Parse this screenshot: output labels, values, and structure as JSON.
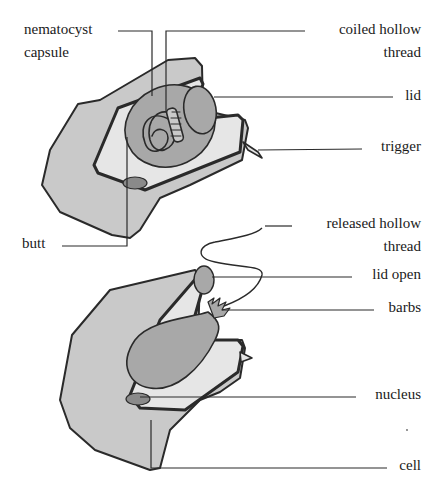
{
  "diagram": {
    "colors": {
      "cell_fill": "#c9c9c9",
      "capsule_fill": "#e6e6e6",
      "organelle_fill": "#a8a8a8",
      "outline": "#2a2a2a",
      "leader_line": "#2a2a2a"
    },
    "top_figure": {
      "state": "undischarged",
      "labels": [
        {
          "id": "nematocyst-capsule",
          "line1": "nematocyst",
          "line2": "capsule"
        },
        {
          "id": "coiled-hollow-thread",
          "line1": "coiled hollow",
          "line2": "thread"
        },
        {
          "id": "lid",
          "line1": "lid"
        },
        {
          "id": "trigger",
          "line1": "trigger"
        },
        {
          "id": "butt",
          "line1": "butt"
        }
      ]
    },
    "bottom_figure": {
      "state": "discharged",
      "labels": [
        {
          "id": "released-hollow-thread",
          "line1": "released hollow",
          "line2": "thread"
        },
        {
          "id": "lid-open",
          "line1": "lid open"
        },
        {
          "id": "barbs",
          "line1": "barbs"
        },
        {
          "id": "nucleus",
          "line1": "nucleus"
        },
        {
          "id": "cell",
          "line1": "cell"
        }
      ]
    }
  }
}
